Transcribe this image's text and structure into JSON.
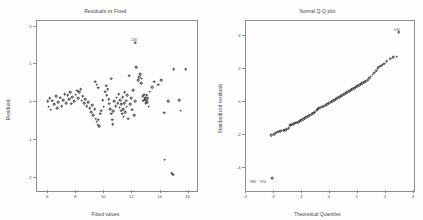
{
  "figure": {
    "width": 423,
    "height": 220,
    "background": "#fdfdfc",
    "marker_color": "#2b2b2b",
    "axis_color": "#8d8d8d"
  },
  "chart_data": [
    {
      "type": "scatter",
      "title": "Residuals vs Fitted",
      "xlabel": "Fitted values",
      "ylabel": "Residuals",
      "xlim": [
        5.2,
        16.6
      ],
      "ylim": [
        -2.35,
        2.15
      ],
      "xticks": [
        6,
        8,
        10,
        12,
        14,
        16
      ],
      "xticklabels": [
        "6",
        "8",
        "10",
        "12",
        "14",
        "16"
      ],
      "yticks": [
        -2,
        -1,
        0,
        1,
        2
      ],
      "yticklabels": [
        "-2",
        "-1",
        "0",
        "1",
        "2"
      ],
      "grid": false,
      "legend": null,
      "annotations": [
        {
          "text": "240",
          "x": 12.2,
          "y": 1.62
        }
      ],
      "points": [
        {
          "x": 5.95,
          "y": 0.02
        },
        {
          "x": 6.02,
          "y": -0.12
        },
        {
          "x": 6.1,
          "y": 0.1
        },
        {
          "x": 6.18,
          "y": -0.2
        },
        {
          "x": 6.3,
          "y": 0.04
        },
        {
          "x": 6.42,
          "y": -0.06
        },
        {
          "x": 6.55,
          "y": 0.16
        },
        {
          "x": 6.62,
          "y": -0.16
        },
        {
          "x": 6.7,
          "y": 0.0
        },
        {
          "x": 6.85,
          "y": 0.12
        },
        {
          "x": 6.95,
          "y": -0.1
        },
        {
          "x": 7.05,
          "y": 0.06
        },
        {
          "x": 7.18,
          "y": 0.22
        },
        {
          "x": 7.28,
          "y": -0.02
        },
        {
          "x": 7.38,
          "y": 0.18
        },
        {
          "x": 7.48,
          "y": 0.08
        },
        {
          "x": 7.55,
          "y": 0.26
        },
        {
          "x": 7.62,
          "y": -0.04
        },
        {
          "x": 7.72,
          "y": 0.14
        },
        {
          "x": 7.85,
          "y": 0.02
        },
        {
          "x": 7.95,
          "y": 0.2
        },
        {
          "x": 8.05,
          "y": 0.3
        },
        {
          "x": 8.12,
          "y": 0.1
        },
        {
          "x": 8.22,
          "y": 0.26
        },
        {
          "x": 8.3,
          "y": 0.34
        },
        {
          "x": 8.38,
          "y": 0.04
        },
        {
          "x": 8.45,
          "y": 0.16
        },
        {
          "x": 8.55,
          "y": -0.02
        },
        {
          "x": 8.65,
          "y": 0.08
        },
        {
          "x": 8.75,
          "y": -0.1
        },
        {
          "x": 8.85,
          "y": 0.0
        },
        {
          "x": 8.95,
          "y": -0.16
        },
        {
          "x": 9.05,
          "y": -0.26
        },
        {
          "x": 9.12,
          "y": -0.08
        },
        {
          "x": 9.22,
          "y": -0.34
        },
        {
          "x": 9.3,
          "y": -0.18
        },
        {
          "x": 9.38,
          "y": -0.44
        },
        {
          "x": 9.45,
          "y": -0.52
        },
        {
          "x": 9.52,
          "y": -0.6
        },
        {
          "x": 9.58,
          "y": -0.46
        },
        {
          "x": 9.62,
          "y": -0.64
        },
        {
          "x": 9.7,
          "y": -0.3
        },
        {
          "x": 9.45,
          "y": 0.46
        },
        {
          "x": 9.55,
          "y": 0.38
        },
        {
          "x": 9.35,
          "y": 0.54
        },
        {
          "x": 9.78,
          "y": -0.22
        },
        {
          "x": 9.88,
          "y": 0.06
        },
        {
          "x": 9.95,
          "y": -0.12
        },
        {
          "x": 10.05,
          "y": 0.28
        },
        {
          "x": 10.12,
          "y": 0.44
        },
        {
          "x": 10.18,
          "y": 0.18
        },
        {
          "x": 10.25,
          "y": 0.34
        },
        {
          "x": 10.3,
          "y": 0.08
        },
        {
          "x": 10.35,
          "y": -0.04
        },
        {
          "x": 10.42,
          "y": -0.18
        },
        {
          "x": 10.48,
          "y": -0.3
        },
        {
          "x": 10.55,
          "y": -0.46
        },
        {
          "x": 10.6,
          "y": -0.58
        },
        {
          "x": 10.48,
          "y": 0.62
        },
        {
          "x": 10.62,
          "y": -0.24
        },
        {
          "x": 10.72,
          "y": 0.02
        },
        {
          "x": 10.8,
          "y": -0.1
        },
        {
          "x": 10.88,
          "y": 0.12
        },
        {
          "x": 10.95,
          "y": -0.02
        },
        {
          "x": 11.02,
          "y": 0.22
        },
        {
          "x": 11.08,
          "y": -0.14
        },
        {
          "x": 11.12,
          "y": 0.06
        },
        {
          "x": 11.18,
          "y": -0.22
        },
        {
          "x": 11.22,
          "y": -0.06
        },
        {
          "x": 11.26,
          "y": -0.3
        },
        {
          "x": 11.3,
          "y": 0.14
        },
        {
          "x": 11.34,
          "y": -0.18
        },
        {
          "x": 11.38,
          "y": -0.38
        },
        {
          "x": 11.42,
          "y": -0.02
        },
        {
          "x": 11.46,
          "y": 0.26
        },
        {
          "x": 11.5,
          "y": -0.26
        },
        {
          "x": 11.54,
          "y": 0.04
        },
        {
          "x": 11.58,
          "y": -0.12
        },
        {
          "x": 11.62,
          "y": 0.18
        },
        {
          "x": 11.68,
          "y": -0.44
        },
        {
          "x": 11.75,
          "y": 0.7
        },
        {
          "x": 11.82,
          "y": -0.06
        },
        {
          "x": 11.9,
          "y": 0.1
        },
        {
          "x": 11.98,
          "y": -0.2
        },
        {
          "x": 12.05,
          "y": 0.32
        },
        {
          "x": 12.12,
          "y": -0.34
        },
        {
          "x": 12.2,
          "y": 0.02
        },
        {
          "x": 12.28,
          "y": 0.92
        },
        {
          "x": 12.4,
          "y": 0.58
        },
        {
          "x": 12.48,
          "y": 0.66
        },
        {
          "x": 12.55,
          "y": 0.74
        },
        {
          "x": 12.62,
          "y": 0.5
        },
        {
          "x": 12.66,
          "y": 0.62
        },
        {
          "x": 12.72,
          "y": 0.16
        },
        {
          "x": 12.78,
          "y": 0.04
        },
        {
          "x": 12.82,
          "y": 0.2
        },
        {
          "x": 12.86,
          "y": 0.08
        },
        {
          "x": 12.9,
          "y": 0.12
        },
        {
          "x": 12.94,
          "y": -0.02
        },
        {
          "x": 12.98,
          "y": 0.06
        },
        {
          "x": 13.02,
          "y": 0.18
        },
        {
          "x": 13.06,
          "y": 0.0
        },
        {
          "x": 13.1,
          "y": 0.1
        },
        {
          "x": 13.16,
          "y": -0.12
        },
        {
          "x": 13.24,
          "y": 0.28
        },
        {
          "x": 13.4,
          "y": 0.4
        },
        {
          "x": 13.55,
          "y": 0.54
        },
        {
          "x": 13.85,
          "y": 0.46
        },
        {
          "x": 14.05,
          "y": 0.58
        },
        {
          "x": 14.25,
          "y": -0.28
        },
        {
          "x": 14.55,
          "y": 0.02
        },
        {
          "x": 14.95,
          "y": 0.88
        },
        {
          "x": 15.35,
          "y": 0.06
        },
        {
          "x": 15.45,
          "y": -0.22
        },
        {
          "x": 15.8,
          "y": 0.88
        },
        {
          "x": 14.3,
          "y": -1.52
        },
        {
          "x": 14.8,
          "y": -1.88
        },
        {
          "x": 14.92,
          "y": -1.92
        },
        {
          "x": 12.18,
          "y": 1.58
        }
      ]
    },
    {
      "type": "scatter",
      "title": "Normal Q-Q plot",
      "xlabel": "Theoretical Quantiles",
      "ylabel": "Standardized residuals",
      "xlim": [
        -3,
        3
      ],
      "ylim": [
        -5.4,
        4.9
      ],
      "xticks": [
        -3,
        -2,
        -1,
        0,
        1,
        2,
        3
      ],
      "xticklabels": [
        "-3",
        "-2",
        "-1",
        "0",
        "1",
        "2",
        "3"
      ],
      "yticks": [
        -4,
        -2,
        0,
        2,
        4
      ],
      "yticklabels": [
        "-4",
        "-2",
        "0",
        "2",
        "4"
      ],
      "grid": false,
      "legend": null,
      "annotations": [
        {
          "text": "240",
          "x": 2.42,
          "y": 4.28
        },
        {
          "text": "980",
          "x": -2.72,
          "y": -4.92
        },
        {
          "text": "970",
          "x": -2.36,
          "y": -4.92
        }
      ],
      "points": [
        {
          "x": -2.1,
          "y": -2.02
        },
        {
          "x": -2.0,
          "y": -1.96
        },
        {
          "x": -1.92,
          "y": -1.88
        },
        {
          "x": -1.84,
          "y": -1.8
        },
        {
          "x": -1.78,
          "y": -1.76
        },
        {
          "x": -1.72,
          "y": -1.74
        },
        {
          "x": -1.66,
          "y": -1.72
        },
        {
          "x": -1.6,
          "y": -1.7
        },
        {
          "x": -1.54,
          "y": -1.64
        },
        {
          "x": -1.48,
          "y": -1.6
        },
        {
          "x": -1.42,
          "y": -1.42
        },
        {
          "x": -1.38,
          "y": -1.38
        },
        {
          "x": -1.32,
          "y": -1.34
        },
        {
          "x": -1.26,
          "y": -1.3
        },
        {
          "x": -1.2,
          "y": -1.26
        },
        {
          "x": -1.14,
          "y": -1.22
        },
        {
          "x": -1.08,
          "y": -1.18
        },
        {
          "x": -1.02,
          "y": -1.12
        },
        {
          "x": -0.96,
          "y": -1.06
        },
        {
          "x": -0.9,
          "y": -1.0
        },
        {
          "x": -0.84,
          "y": -0.94
        },
        {
          "x": -0.78,
          "y": -0.88
        },
        {
          "x": -0.72,
          "y": -0.82
        },
        {
          "x": -0.66,
          "y": -0.76
        },
        {
          "x": -0.6,
          "y": -0.7
        },
        {
          "x": -0.54,
          "y": -0.62
        },
        {
          "x": -0.48,
          "y": -0.5
        },
        {
          "x": -0.44,
          "y": -0.44
        },
        {
          "x": -0.4,
          "y": -0.4
        },
        {
          "x": -0.34,
          "y": -0.36
        },
        {
          "x": -0.28,
          "y": -0.3
        },
        {
          "x": -0.22,
          "y": -0.26
        },
        {
          "x": -0.16,
          "y": -0.2
        },
        {
          "x": -0.1,
          "y": -0.14
        },
        {
          "x": -0.04,
          "y": -0.08
        },
        {
          "x": 0.02,
          "y": -0.02
        },
        {
          "x": 0.08,
          "y": 0.04
        },
        {
          "x": 0.14,
          "y": 0.1
        },
        {
          "x": 0.2,
          "y": 0.16
        },
        {
          "x": 0.26,
          "y": 0.22
        },
        {
          "x": 0.32,
          "y": 0.28
        },
        {
          "x": 0.38,
          "y": 0.34
        },
        {
          "x": 0.44,
          "y": 0.4
        },
        {
          "x": 0.5,
          "y": 0.46
        },
        {
          "x": 0.56,
          "y": 0.52
        },
        {
          "x": 0.62,
          "y": 0.58
        },
        {
          "x": 0.68,
          "y": 0.64
        },
        {
          "x": 0.74,
          "y": 0.7
        },
        {
          "x": 0.8,
          "y": 0.76
        },
        {
          "x": 0.86,
          "y": 0.82
        },
        {
          "x": 0.92,
          "y": 0.88
        },
        {
          "x": 0.98,
          "y": 0.94
        },
        {
          "x": 1.04,
          "y": 1.0
        },
        {
          "x": 1.1,
          "y": 1.06
        },
        {
          "x": 1.16,
          "y": 1.12
        },
        {
          "x": 1.22,
          "y": 1.18
        },
        {
          "x": 1.28,
          "y": 1.24
        },
        {
          "x": 1.34,
          "y": 1.32
        },
        {
          "x": 1.4,
          "y": 1.44
        },
        {
          "x": 1.46,
          "y": 1.52
        },
        {
          "x": 1.52,
          "y": 1.64
        },
        {
          "x": 1.58,
          "y": 1.78
        },
        {
          "x": 1.64,
          "y": 1.9
        },
        {
          "x": 1.7,
          "y": 2.04
        },
        {
          "x": 1.76,
          "y": 2.12
        },
        {
          "x": 1.82,
          "y": 2.2
        },
        {
          "x": 1.88,
          "y": 2.26
        },
        {
          "x": 1.94,
          "y": 2.32
        },
        {
          "x": 2.02,
          "y": 2.46
        },
        {
          "x": 2.14,
          "y": 2.62
        },
        {
          "x": 2.26,
          "y": 2.7
        },
        {
          "x": 2.38,
          "y": 2.74
        },
        {
          "x": -2.06,
          "y": -4.62
        },
        {
          "x": 2.46,
          "y": 4.22
        }
      ]
    }
  ]
}
